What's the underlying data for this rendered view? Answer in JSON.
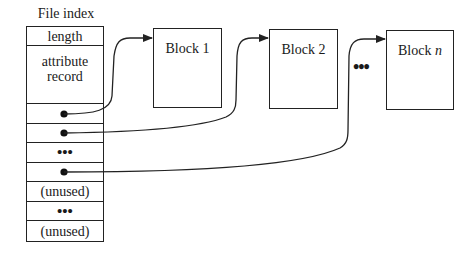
{
  "diagram": {
    "title": "File index",
    "index_rows": [
      {
        "kind": "text",
        "label": "length",
        "height": 19
      },
      {
        "kind": "text",
        "label": "attribute\nrecord",
        "height": 58
      },
      {
        "kind": "pointer",
        "label": "",
        "height": 20,
        "target": "Block 1"
      },
      {
        "kind": "pointer",
        "label": "",
        "height": 19,
        "target": "Block 2"
      },
      {
        "kind": "ellipsis",
        "label": "•••",
        "height": 20
      },
      {
        "kind": "pointer",
        "label": "",
        "height": 19,
        "target": "Block n"
      },
      {
        "kind": "text",
        "label": "(unused)",
        "height": 20
      },
      {
        "kind": "ellipsis",
        "label": "•••",
        "height": 19
      },
      {
        "kind": "text",
        "label": "(unused)",
        "height": 20
      }
    ],
    "blocks": [
      {
        "label": "Block 1",
        "italic_suffix": ""
      },
      {
        "label": "Block ",
        "italic_suffix": "n",
        "display": "Block 2"
      },
      {
        "label": "Block ",
        "italic_suffix": "n"
      }
    ],
    "block_labels": {
      "block1": "Block 1",
      "block2": "Block 2",
      "blockn_prefix": "Block ",
      "blockn_var": "n"
    },
    "between_blocks_ellipsis": "•••",
    "row_labels": {
      "length": "length",
      "attribute_line1": "attribute",
      "attribute_line2": "record",
      "ellipsis": "•••",
      "unused": "(unused)"
    },
    "colors": {
      "stroke": "#222222",
      "background": "#ffffff"
    }
  }
}
